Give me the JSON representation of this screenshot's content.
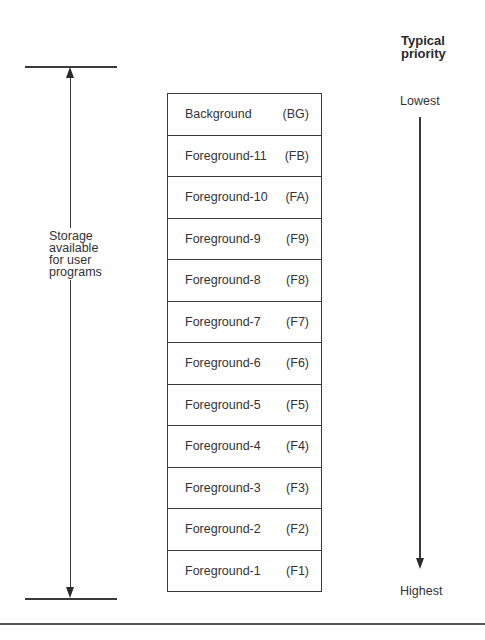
{
  "priority_header": {
    "line1": "Typical",
    "line2": "priority"
  },
  "storage_label": {
    "line1": "Storage",
    "line2": "available",
    "line3": "for user",
    "line4": "programs"
  },
  "partitions": [
    {
      "name": "Background",
      "code": "(BG)"
    },
    {
      "name": "Foreground-11",
      "code": "(FB)"
    },
    {
      "name": "Foreground-10",
      "code": "(FA)"
    },
    {
      "name": "Foreground-9",
      "code": "(F9)"
    },
    {
      "name": "Foreground-8",
      "code": "(F8)"
    },
    {
      "name": "Foreground-7",
      "code": "(F7)"
    },
    {
      "name": "Foreground-6",
      "code": "(F6)"
    },
    {
      "name": "Foreground-5",
      "code": "(F5)"
    },
    {
      "name": "Foreground-4",
      "code": "(F4)"
    },
    {
      "name": "Foreground-3",
      "code": "(F3)"
    },
    {
      "name": "Foreground-2",
      "code": "(F2)"
    },
    {
      "name": "Foreground-1",
      "code": "(F1)"
    }
  ],
  "priority_scale": {
    "top_label": "Lowest",
    "bottom_label": "Highest"
  },
  "colors": {
    "line": "#3a3a3a",
    "text": "#333333",
    "background": "#ffffff"
  }
}
